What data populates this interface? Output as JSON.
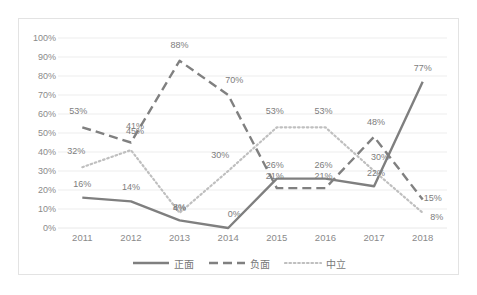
{
  "chart_data": {
    "type": "line",
    "title": "",
    "xlabel": "",
    "ylabel": "",
    "categories": [
      "2011",
      "2012",
      "2013",
      "2014",
      "2015",
      "2016",
      "2017",
      "2018"
    ],
    "ylim": [
      0,
      100
    ],
    "ytick_labels": [
      "0%",
      "10%",
      "20%",
      "30%",
      "40%",
      "50%",
      "60%",
      "70%",
      "80%",
      "90%",
      "100%"
    ],
    "ytick_values": [
      0,
      10,
      20,
      30,
      40,
      50,
      60,
      70,
      80,
      90,
      100
    ],
    "grid": true,
    "legend_position": "bottom",
    "series": [
      {
        "name": "正面",
        "style": "solid",
        "color": "#7f7f7f",
        "values": [
          16,
          14,
          4,
          0,
          26,
          26,
          22,
          77
        ],
        "labels": [
          "16%",
          "14%",
          "4%",
          "0%",
          "26%",
          "26%",
          "22%",
          "77%"
        ]
      },
      {
        "name": "负面",
        "style": "dashed",
        "color": "#808080",
        "values": [
          53,
          45,
          88,
          70,
          21,
          21,
          48,
          15
        ],
        "labels": [
          "53%",
          "45%",
          "88%",
          "70%",
          "21%",
          "21%",
          "48%",
          "15%"
        ]
      },
      {
        "name": "中立",
        "style": "dotted",
        "color": "#bfbfbf",
        "values": [
          32,
          41,
          8,
          30,
          53,
          53,
          30,
          8
        ],
        "labels": [
          "32%",
          "41%",
          "8%",
          "30%",
          "53%",
          "53%",
          "30%",
          "8%"
        ]
      }
    ]
  },
  "colors": {
    "plot_border": "#e3e3e3",
    "gridline": "#e8e8e8",
    "axis_text": "#8a8a8a",
    "label_text": "#7d7d7d",
    "background": "#ffffff"
  }
}
